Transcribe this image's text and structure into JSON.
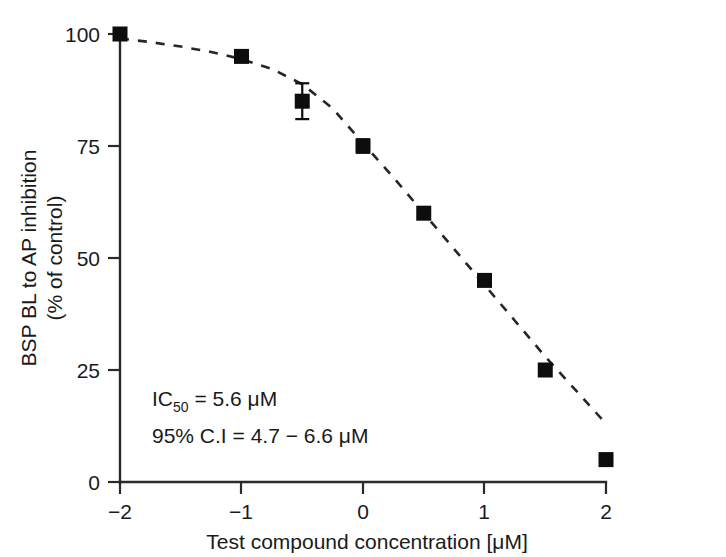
{
  "chart_data": {
    "type": "scatter",
    "title": "",
    "xlabel": "Test compound concentration [μM]",
    "ylabel_line1": "BSP BL to AP inhibition",
    "ylabel_line2": "(% of control)",
    "xlim": [
      -2,
      2
    ],
    "ylim": [
      0,
      100
    ],
    "grid": false,
    "legend": "none",
    "xticks": [
      "−2",
      "−1",
      "0",
      "1",
      "2"
    ],
    "xtick_values": [
      -2,
      -1,
      0,
      1,
      2
    ],
    "yticks": [
      "0",
      "25",
      "50",
      "75",
      "100"
    ],
    "ytick_values": [
      0,
      25,
      50,
      75,
      100
    ],
    "x": [
      -2,
      -1,
      -0.5,
      0,
      0.5,
      1,
      1.5,
      2
    ],
    "values": [
      100,
      95,
      85,
      75,
      60,
      45,
      25,
      5
    ],
    "errors": [
      0,
      0,
      4,
      1.5,
      0,
      0,
      0,
      0
    ],
    "series": [
      {
        "name": "BSP BL to AP inhibition",
        "marker": "filled-square",
        "color": "#0d0d0d",
        "points": [
          {
            "x": -2,
            "y": 100,
            "err": 0
          },
          {
            "x": -1,
            "y": 95,
            "err": 0
          },
          {
            "x": -0.5,
            "y": 85,
            "err": 4
          },
          {
            "x": 0,
            "y": 75,
            "err": 1.5
          },
          {
            "x": 0.5,
            "y": 60,
            "err": 0
          },
          {
            "x": 1,
            "y": 45,
            "err": 0
          },
          {
            "x": 1.5,
            "y": 25,
            "err": 0
          },
          {
            "x": 2,
            "y": 5,
            "err": 0
          }
        ]
      }
    ],
    "fit_curve": {
      "style": "dashed",
      "color": "#262626",
      "points": [
        {
          "x": -2,
          "y": 99.0
        },
        {
          "x": -1.75,
          "y": 98.2
        },
        {
          "x": -1.5,
          "y": 97.2
        },
        {
          "x": -1.25,
          "y": 96.0
        },
        {
          "x": -1,
          "y": 94.4
        },
        {
          "x": -0.75,
          "y": 92.2
        },
        {
          "x": -0.5,
          "y": 88.8
        },
        {
          "x": -0.25,
          "y": 83.4
        },
        {
          "x": 0,
          "y": 75.6
        },
        {
          "x": 0.25,
          "y": 68.0
        },
        {
          "x": 0.5,
          "y": 60.0
        },
        {
          "x": 0.75,
          "y": 52.0
        },
        {
          "x": 1,
          "y": 44.0
        },
        {
          "x": 1.25,
          "y": 36.0
        },
        {
          "x": 1.5,
          "y": 28.0
        },
        {
          "x": 1.75,
          "y": 20.5
        },
        {
          "x": 2,
          "y": 13.0
        }
      ]
    },
    "annotations": [
      {
        "id": "ic50",
        "prefix": "IC",
        "subscript": "50",
        "suffix": " = 5.6 μM"
      },
      {
        "id": "confidence-interval",
        "text": "95% C.I = 4.7 − 6.6 μM"
      }
    ]
  }
}
